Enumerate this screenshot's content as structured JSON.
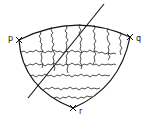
{
  "diagram": {
    "points": [
      {
        "label": "p",
        "x": 19,
        "y": 40
      },
      {
        "label": "q",
        "x": 130,
        "y": 37
      },
      {
        "label": "r",
        "x": 73,
        "y": 108
      }
    ],
    "line": {
      "x1": 104,
      "y1": 4,
      "x2": 28,
      "y2": 98
    },
    "colors": {
      "stroke": "#111111",
      "background": "#ffffff"
    }
  }
}
